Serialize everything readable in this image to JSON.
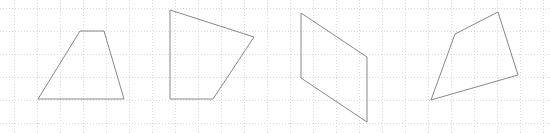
{
  "figure": {
    "width": 550,
    "height": 133,
    "background_color": "#ffffff"
  },
  "grid": {
    "name": "dotted-graph-grid",
    "color": "#d9d9de",
    "spacing": 23,
    "offset_x": 14,
    "offset_y": 8,
    "dash": "1 2",
    "stroke_width": 1,
    "visible": true
  },
  "shapes": {
    "stroke_color": "#878787",
    "stroke_width": 1,
    "fill": "none",
    "count": 4,
    "items": [
      {
        "name": "trapezoid-1",
        "label": "Shape 1",
        "kind": "trapezoid",
        "vertices": [
          [
            38,
            99
          ],
          [
            80,
            31
          ],
          [
            104,
            31
          ],
          [
            124,
            99
          ]
        ],
        "points": "38,99 80,31 104,31 124,99"
      },
      {
        "name": "quadrilateral-2",
        "label": "Shape 2",
        "kind": "irregular quadrilateral",
        "vertices": [
          [
            170,
            10
          ],
          [
            254,
            37
          ],
          [
            213,
            99
          ],
          [
            170,
            99
          ]
        ],
        "points": "170,10 254,37 213,99 170,99"
      },
      {
        "name": "parallelogram-3",
        "label": "Shape 3",
        "kind": "parallelogram",
        "vertices": [
          [
            301,
            13
          ],
          [
            367,
            57
          ],
          [
            367,
            122
          ],
          [
            301,
            78
          ]
        ],
        "points": "301,13 367,57 367,122 301,78"
      },
      {
        "name": "quadrilateral-4",
        "label": "Shape 4",
        "kind": "irregular quadrilateral",
        "vertices": [
          [
            455,
            34
          ],
          [
            498,
            12
          ],
          [
            518,
            75
          ],
          [
            431,
            100
          ]
        ],
        "points": "455,34 498,12 518,75 431,100"
      }
    ]
  }
}
